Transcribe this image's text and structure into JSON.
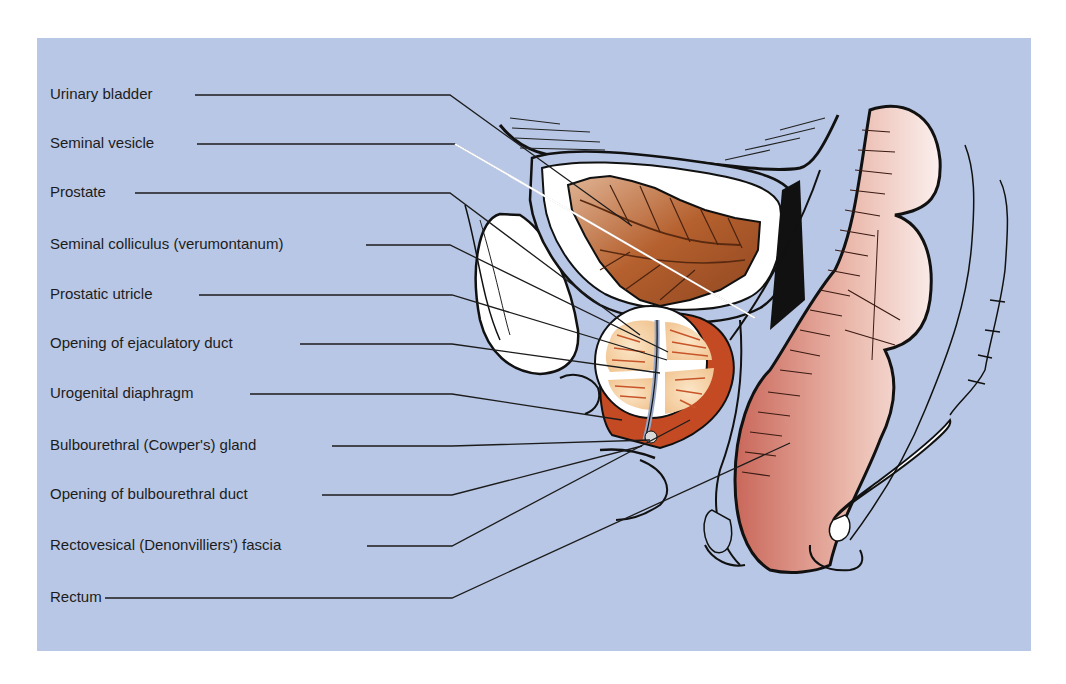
{
  "figure": {
    "background_color": "#b8c7e5",
    "labels": [
      {
        "text": "Urinary bladder",
        "y": 95,
        "x0": 195,
        "bx": 450,
        "tx": 632,
        "ty": 226,
        "color": "#1c1c1c"
      },
      {
        "text": "Seminal vesicle",
        "y": 144,
        "x0": 197,
        "bx": 455,
        "tx": 755,
        "ty": 318,
        "color": "#ffffff"
      },
      {
        "text": "Prostate",
        "y": 193,
        "x0": 135,
        "bx": 450,
        "tx": 640,
        "ty": 335,
        "color": "#1c1c1c"
      },
      {
        "text": "Seminal colliculus (verumontanum)",
        "y": 245,
        "x0": 366,
        "bx": 450,
        "tx": 668,
        "ty": 352,
        "color": "#1c1c1c"
      },
      {
        "text": "Prostatic utricle",
        "y": 295,
        "x0": 199,
        "bx": 452,
        "tx": 667,
        "ty": 360,
        "color": "#1c1c1c"
      },
      {
        "text": "Opening of ejaculatory duct",
        "y": 344,
        "x0": 300,
        "bx": 452,
        "tx": 660,
        "ty": 373,
        "color": "#1c1c1c"
      },
      {
        "text": "Urogenital diaphragm",
        "y": 394,
        "x0": 250,
        "bx": 452,
        "tx": 622,
        "ty": 420,
        "color": "#1c1c1c"
      },
      {
        "text": "Bulbourethral (Cowper's) gland",
        "y": 446,
        "x0": 332,
        "bx": 452,
        "tx": 650,
        "ty": 440,
        "color": "#1c1c1c"
      },
      {
        "text": "Opening of bulbourethral duct",
        "y": 495,
        "x0": 322,
        "bx": 452,
        "tx": 642,
        "ty": 446,
        "color": "#1c1c1c"
      },
      {
        "text": "Rectovesical (Denonvilliers') fascia",
        "y": 546,
        "x0": 367,
        "bx": 452,
        "tx": 690,
        "ty": 420,
        "color": "#1c1c1c"
      },
      {
        "text": "Rectum",
        "y": 598,
        "x0": 105,
        "bx": 452,
        "tx": 790,
        "ty": 443,
        "color": "#1c1c1c"
      }
    ]
  }
}
